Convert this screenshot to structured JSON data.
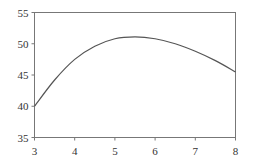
{
  "chart_data": {
    "type": "line",
    "title": "",
    "xlabel": "",
    "ylabel": "",
    "xlim": [
      3,
      8
    ],
    "ylim": [
      35,
      55
    ],
    "grid": false,
    "legend": null,
    "x_ticks": [
      "3",
      "4",
      "5",
      "6",
      "7",
      "8"
    ],
    "y_ticks": [
      "35",
      "40",
      "45",
      "50",
      "55"
    ],
    "series": [
      {
        "name": "curve",
        "color": "#555555",
        "x": [
          3,
          3.5,
          4,
          4.5,
          5,
          5.5,
          6,
          6.5,
          7,
          7.5,
          8
        ],
        "y": [
          40,
          44.2,
          47.5,
          49.6,
          50.8,
          51.1,
          50.8,
          50.0,
          48.8,
          47.3,
          45.5
        ]
      }
    ]
  }
}
